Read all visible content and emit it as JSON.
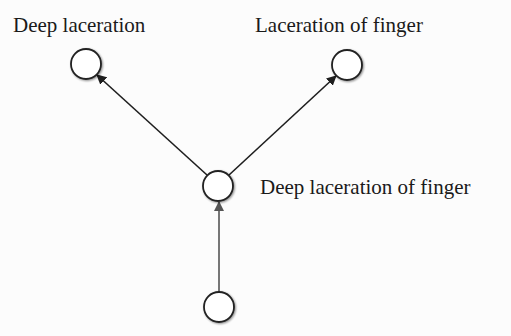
{
  "diagram": {
    "type": "hierarchy",
    "nodes": [
      {
        "id": "n_deep_laceration",
        "label": "Deep laceration",
        "cx": 86,
        "cy": 64,
        "r": 15
      },
      {
        "id": "n_laceration_of_finger",
        "label": "Laceration of finger",
        "cx": 347,
        "cy": 65,
        "r": 15
      },
      {
        "id": "n_deep_laceration_of_finger",
        "label": "Deep laceration of finger",
        "cx": 218,
        "cy": 186,
        "r": 15
      },
      {
        "id": "n_bottom",
        "label": "",
        "cx": 219,
        "cy": 307,
        "r": 15
      }
    ],
    "edges": [
      {
        "from": "n_deep_laceration_of_finger",
        "to": "n_deep_laceration"
      },
      {
        "from": "n_deep_laceration_of_finger",
        "to": "n_laceration_of_finger"
      },
      {
        "from": "n_bottom",
        "to": "n_deep_laceration_of_finger"
      }
    ],
    "labels": {
      "top_left": "Deep laceration",
      "top_right": "Laceration of finger",
      "middle": "Deep laceration of finger"
    },
    "colors": {
      "node_stroke": "#222222",
      "node_fill": "#ffffff",
      "edge_dark": "#1e1e1e",
      "edge_gray": "#555555",
      "text": "#1a1a1a",
      "background": "#fcfcfc"
    }
  }
}
